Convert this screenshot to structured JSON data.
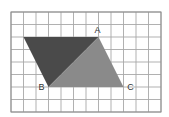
{
  "diagram": {
    "type": "grid-geometry",
    "grid": {
      "columns": 12,
      "rows": 8,
      "origin_px": [
        11,
        12
      ],
      "cell_px": 12.5,
      "line_color": "#a8a8a8",
      "border_color": "#8c8c8c"
    },
    "points": {
      "D": {
        "col": 1,
        "row": 2,
        "label": ""
      },
      "A": {
        "col": 7,
        "row": 2,
        "label": "A"
      },
      "B": {
        "col": 3,
        "row": 6,
        "label": "B"
      },
      "C": {
        "col": 9,
        "row": 6,
        "label": "C"
      }
    },
    "shapes": [
      {
        "name": "dark-triangle",
        "vertices": [
          "D",
          "A",
          "B"
        ],
        "fill": "#4a4a4a"
      },
      {
        "name": "light-triangle",
        "vertices": [
          "A",
          "B",
          "C"
        ],
        "fill": "#8a8a8a"
      }
    ],
    "labels": {
      "A": "A",
      "B": "B",
      "C": "C"
    }
  }
}
